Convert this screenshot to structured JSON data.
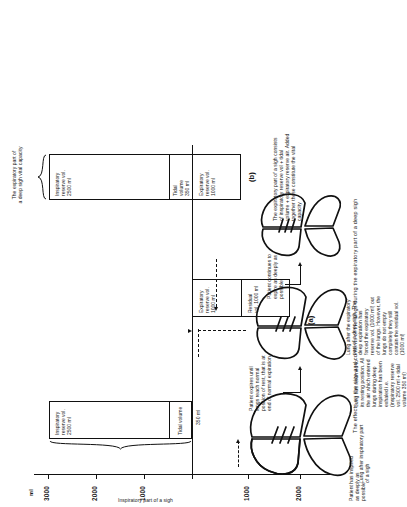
{
  "figure": {
    "caption": "The effects on the size and contents of the lungs during the expiratory part of a deep sigh",
    "panel_a_id": "(a)",
    "panel_b_id": "(b)"
  },
  "axis": {
    "unit_label": "ml",
    "above_ticks": [
      "3000",
      "2000",
      "1000"
    ],
    "below_ticks": [
      "1000",
      "2000"
    ],
    "baseline_label": "350 ml"
  },
  "annotations": {
    "top_left": "Patient has inspired as deeply as possible",
    "step1": "Patient expires until lungs reach normal position of rest, that is at end of normal expiration",
    "step2": "Patient continues to expire as deeply as possible",
    "lung1_label": "Lung after inspiratory part of a sigh",
    "lung2_label": "Lung has returned to its resting position. All the air which entered lungs during deep inspiration has been exhaled i.e. (inspiratory reserve vol. 2500 ml + tidal volume 350 ml)",
    "lung3_label": "Lung after the expiratory part of a deep sigh. The deep expiration has forced the expiratory reserve vol. (1000 ml) out of the lungs. However, the lungs do not empty completely they still contain the residual vol. (1000 ml)",
    "brace_a_label": "Inspiratory part of a sigh",
    "brace_b_label": "The expiratory part of\na deep sigh vital capacity",
    "panel_b_note": "The expiratory part of a sigh consists of inspiratory reserve vol + tidal volume + expiratory reserve air. Added together these constitute the vital capacity"
  },
  "boxes": {
    "panel_a_left": {
      "segments": [
        {
          "name": "inspiratory-reserve",
          "label": "Inspiratory\nreserve vol.\n2500 ml"
        },
        {
          "name": "tidal-volume",
          "label": "Tidal volume"
        }
      ]
    },
    "panel_a_middle": {
      "segments": [
        {
          "name": "expiratory-reserve",
          "label": "Expiratory\nreserve vol.\n1000 ml"
        },
        {
          "name": "residual",
          "label": "Residual\nvol. 1000 ml"
        }
      ]
    },
    "panel_b": {
      "segments": [
        {
          "name": "inspiratory-reserve",
          "label": "Inspiratory\nreserve vol.\n2500 ml"
        },
        {
          "name": "tidal-volume",
          "label": "Tidal\nvolume\n350 ml"
        },
        {
          "name": "expiratory-reserve",
          "label": "Expiratory\nreserve vol.\n1000 ml"
        }
      ]
    }
  },
  "colors": {
    "ink": "#111111",
    "paper": "#ffffff"
  }
}
